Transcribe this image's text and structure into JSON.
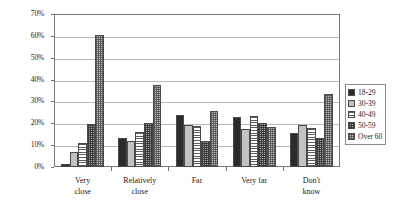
{
  "chart_data": {
    "type": "bar",
    "title": "",
    "subtitle": "",
    "xlabel": "",
    "ylabel": "",
    "ylim": [
      0,
      70
    ],
    "ytick_labels": [
      "0%",
      "10%",
      "20%",
      "30%",
      "40%",
      "50%",
      "60%",
      "70%"
    ],
    "ytick_values": [
      0,
      10,
      20,
      30,
      40,
      50,
      60,
      70
    ],
    "grid": true,
    "legend_position": "right",
    "value_suffix": "%",
    "categories": [
      "Very\nclose",
      "Relatively\nclose",
      "Far",
      "Very far",
      "Don't\nknow"
    ],
    "series": [
      {
        "name": "18-29",
        "pattern": "solid-black",
        "values": [
          1.3,
          13.5,
          24.0,
          22.7,
          15.5
        ]
      },
      {
        "name": "30-39",
        "pattern": "solid-light-gray",
        "values": [
          7.0,
          12.0,
          19.3,
          17.6,
          19.4
        ]
      },
      {
        "name": "40-49",
        "pattern": "horizontal-lines",
        "values": [
          10.8,
          16.2,
          18.7,
          23.4,
          18.0
        ]
      },
      {
        "name": "50-59",
        "pattern": "dark-crosshatch",
        "values": [
          19.8,
          20.0,
          12.0,
          20.0,
          13.4
        ]
      },
      {
        "name": "Over 60",
        "pattern": "light-crosshatch",
        "values": [
          60.4,
          37.4,
          25.8,
          18.4,
          33.2
        ]
      }
    ]
  },
  "legend": {
    "items": [
      {
        "label": "18-29"
      },
      {
        "label": "30-39"
      },
      {
        "label": "40-49"
      },
      {
        "label": "50-59"
      },
      {
        "label": "Over 60"
      }
    ]
  }
}
